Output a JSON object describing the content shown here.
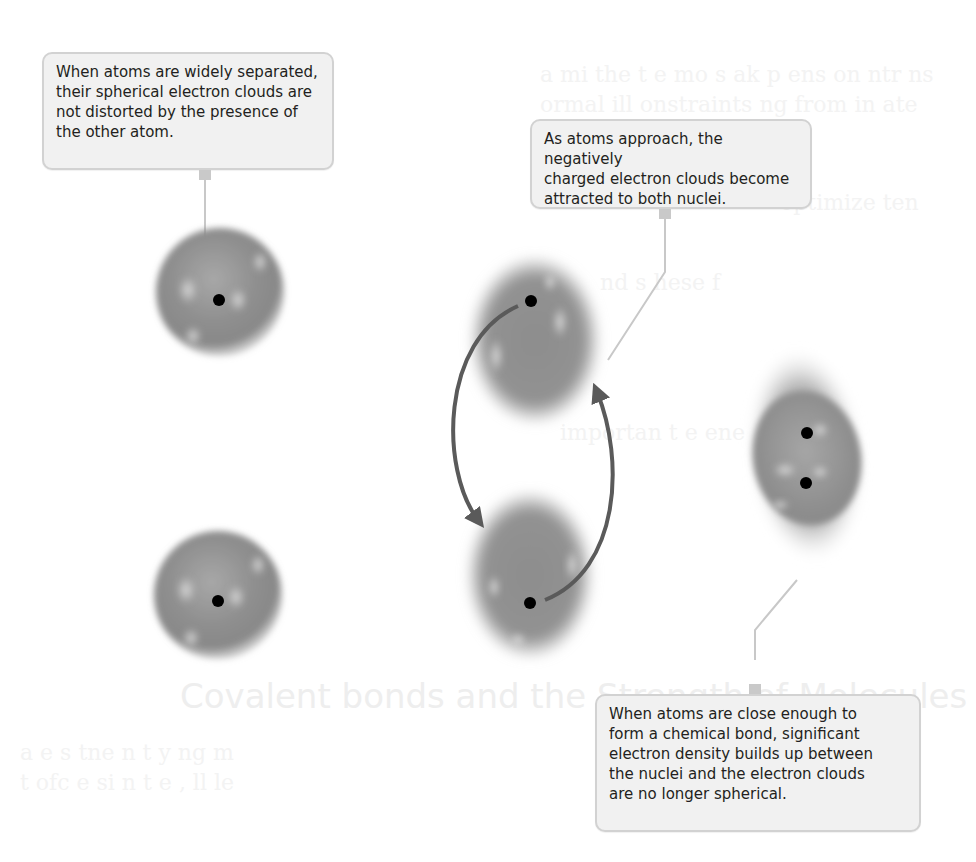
{
  "figure": {
    "colors": {
      "electron_cloud": "#8e8e8e",
      "cloud_highlight": "#c9c9c9",
      "nucleus": "#000000",
      "arrow": "#5a5a5a",
      "callout_fill": "#f1f1f1",
      "callout_border": "#d2d2d2",
      "leader_line": "#c8c8c8",
      "text": "#231f20"
    },
    "callouts": [
      {
        "id": "separated",
        "lines": [
          "When atoms are widely separated,",
          "their spherical electron clouds are",
          "not distorted by the presence of",
          "the other atom."
        ]
      },
      {
        "id": "approaching",
        "lines": [
          "As atoms approach, the negatively",
          "charged electron clouds become",
          "attracted to both nuclei."
        ]
      },
      {
        "id": "bonded",
        "lines": [
          "When atoms are close enough to",
          "form a chemical bond, significant",
          "electron density builds up between",
          "the nuclei and the electron clouds",
          "are no longer spherical."
        ]
      }
    ],
    "stages": [
      {
        "name": "separated",
        "atoms": 2,
        "nuclei": 2
      },
      {
        "name": "approaching",
        "atoms": 2,
        "nuclei": 2,
        "arrows": 2
      },
      {
        "name": "bonded",
        "atoms": 1,
        "nuclei": 2
      }
    ]
  },
  "background_bleed": {
    "heading": "Covalent bonds and the Strength of Molecules",
    "note": "faint ghosted text from reverse page, illegible"
  }
}
